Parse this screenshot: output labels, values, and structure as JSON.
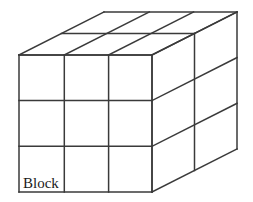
{
  "figure": {
    "title": "Block",
    "label": "Block",
    "label_position": {
      "x": 23,
      "y": 188
    },
    "background_color": "#ffffff",
    "line_color": "#3a3a3a",
    "line_width": 1.5,
    "shape": "rectangular-cuboid-grid",
    "grid": {
      "columns": 3,
      "rows": 3,
      "depth": 2,
      "total_unit_cubes": 18
    },
    "geometry": {
      "front_face": {
        "left": 19,
        "top": 55,
        "right": 152,
        "bottom": 192,
        "x_divisions": [
          19,
          64.3,
          108.6,
          152
        ],
        "y_divisions": [
          55,
          100.6,
          146.3,
          192
        ]
      },
      "depth_vector": {
        "dx": 85,
        "dy": -43
      },
      "depth_divisions": [
        0,
        0.5,
        1
      ],
      "vertices": {
        "front_top_left": [
          19,
          55
        ],
        "front_top_right": [
          152,
          55
        ],
        "front_bottom_left": [
          19,
          192
        ],
        "front_bottom_right": [
          152,
          192
        ],
        "back_top_left": [
          104,
          12
        ],
        "back_top_right": [
          237,
          12
        ],
        "back_bottom_right": [
          237,
          149
        ]
      }
    }
  }
}
